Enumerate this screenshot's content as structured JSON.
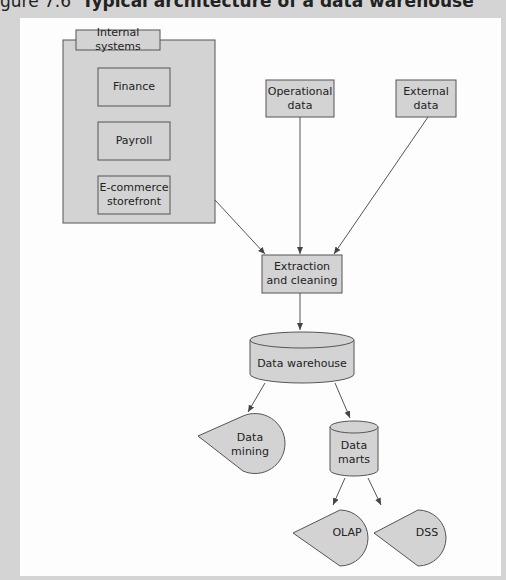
{
  "caption": {
    "prefix": "gure 7.6",
    "title": "Typical architecture of a data warehouse"
  },
  "nodes": {
    "internal_systems": {
      "label": "Internal systems"
    },
    "finance": {
      "label": "Finance"
    },
    "payroll": {
      "label": "Payroll"
    },
    "ecommerce": {
      "label": "E-commerce storefront"
    },
    "operational": {
      "label": "Operational data"
    },
    "external": {
      "label": "External data"
    },
    "extraction": {
      "label": "Extraction and cleaning"
    },
    "warehouse": {
      "label": "Data warehouse"
    },
    "mining": {
      "label": "Data mining"
    },
    "marts": {
      "label": "Data marts"
    },
    "olap": {
      "label": "OLAP"
    },
    "dss": {
      "label": "DSS"
    }
  },
  "colors": {
    "fill": "#d3d3d3",
    "stroke": "#555555",
    "background": "#fdfdfd",
    "frame": "#d4d4d4"
  }
}
